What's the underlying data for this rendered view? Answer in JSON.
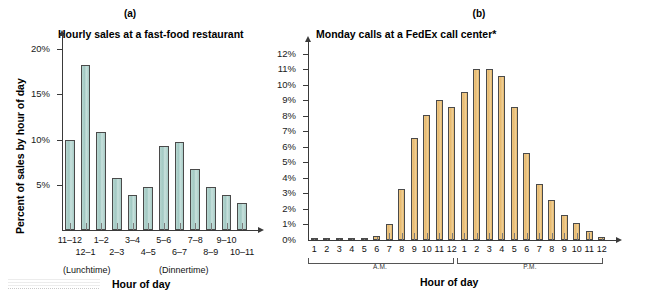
{
  "figure": {
    "panels": [
      {
        "letter": "(a)",
        "title": "Hourly sales at a fast-food restaurant",
        "ylabel": "Percent of sales by hour of day",
        "xlabel": "Hour of day",
        "notes": [
          "(Lunchtime)",
          "(Dinnertime)"
        ],
        "bar_color": "#a8ccc6"
      },
      {
        "letter": "(b)",
        "title": "Monday calls at a FedEx call center*",
        "ylabel": "",
        "xlabel": "Hour of day",
        "groups": [
          "A.M.",
          "P.M."
        ],
        "bar_color": "#e5b76a"
      }
    ]
  },
  "chart_data": [
    {
      "type": "bar",
      "title": "Hourly sales at a fast-food restaurant",
      "panel": "(a)",
      "xlabel": "Hour of day",
      "ylabel": "Percent of sales by hour of day",
      "categories": [
        "11–12",
        "12–1",
        "1–2",
        "2–3",
        "3–4",
        "4–5",
        "5–6",
        "6–7",
        "7–8",
        "8–9",
        "9–10",
        "10–11"
      ],
      "values": [
        10.0,
        18.2,
        10.8,
        5.7,
        3.9,
        4.8,
        9.3,
        9.7,
        6.7,
        4.8,
        3.9,
        3.0
      ],
      "ytick_labels": [
        "5%",
        "10%",
        "15%",
        "20%"
      ],
      "ytick_values": [
        5,
        10,
        15,
        20
      ],
      "ylim": [
        0,
        21
      ],
      "grid": false,
      "legend": "none",
      "annotations": [
        "(Lunchtime)",
        "(Dinnertime)"
      ]
    },
    {
      "type": "bar",
      "title": "Monday calls at a FedEx call center*",
      "panel": "(b)",
      "xlabel": "Hour of day",
      "ylabel": "",
      "categories": [
        "1",
        "2",
        "3",
        "4",
        "5",
        "6",
        "7",
        "8",
        "9",
        "10",
        "11",
        "12",
        "1",
        "2",
        "3",
        "4",
        "5",
        "6",
        "7",
        "8",
        "9",
        "10",
        "11",
        "12"
      ],
      "group_labels": [
        "A.M.",
        "P.M."
      ],
      "values": [
        0.1,
        0.1,
        0.1,
        0.1,
        0.1,
        0.25,
        1.05,
        3.3,
        6.55,
        8.05,
        9.05,
        8.55,
        9.55,
        11.05,
        11.05,
        10.55,
        8.55,
        5.6,
        3.6,
        2.6,
        1.6,
        1.1,
        0.6,
        0.2
      ],
      "ytick_labels": [
        "0%",
        "1%",
        "2%",
        "3%",
        "4%",
        "5%",
        "6%",
        "7%",
        "8%",
        "9%",
        "10%",
        "11%",
        "12%"
      ],
      "ytick_values": [
        0,
        1,
        2,
        3,
        4,
        5,
        6,
        7,
        8,
        9,
        10,
        11,
        12
      ],
      "ylim": [
        0,
        12.5
      ],
      "grid": false,
      "legend": "none"
    }
  ]
}
